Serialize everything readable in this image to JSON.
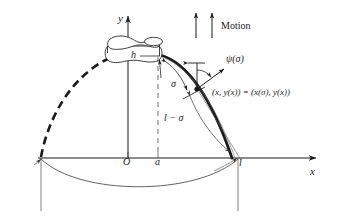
{
  "figure": {
    "kind": "mathematical-diagram",
    "background_color": "#ffffff",
    "ink_color": "#1a1a1a",
    "width": 339,
    "height": 220
  },
  "axes": {
    "x_label": "x",
    "y_label": "y",
    "origin_label": "ℳ",
    "origin_label_plain": "O",
    "x_axis_y": 158,
    "y_axis_x": 128
  },
  "labels": {
    "motion": "Motion",
    "height_h": "h",
    "point_a": "a",
    "length_l": "l",
    "arc_sigma": "σ",
    "arc_remainder": "l − σ",
    "angle_psi": "ψ(σ)",
    "point_coordinates": "(x, y(x)) = (x(σ), y(x))"
  },
  "curve": {
    "solid_description": "thick solid catenary arc from bobbin rim to x = l",
    "dashed_description": "thick dashed catenary arc from left x-intercept to bobbin rim",
    "lower_arc_description": "thin shallow arc below the x axis joining the two endpoints"
  },
  "markers": {
    "point_on_curve": "filled dot at (x(σ), y(x))",
    "motion_arrow_count": 2
  },
  "colors": {
    "ink": "#1a1a1a",
    "thin_ink": "#3a3a3a",
    "background": "#ffffff"
  }
}
